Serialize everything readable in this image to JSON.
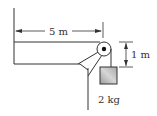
{
  "diagram": {
    "type": "physics-pulley-table",
    "labels": {
      "horizontal_distance": "5 m",
      "vertical_distance": "1 m",
      "mass": "2 kg"
    },
    "colors": {
      "line": "#333333",
      "block_fill": "#b8b8b8",
      "background": "#ffffff"
    }
  }
}
